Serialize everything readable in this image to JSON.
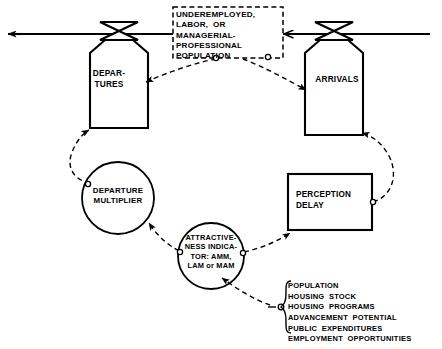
{
  "diagram": {
    "stock": {
      "label": "UNDEREMPLOYED,\nLABOR,  OR\nMANAGERIAL-\nPROFESSIONAL\nPOPULATION",
      "border_style": "dashed"
    },
    "rates": [
      {
        "id": "departures",
        "label": "DEPAR-\nTURES",
        "shape": "valve"
      },
      {
        "id": "arrivals",
        "label": "ARRIVALS",
        "shape": "valve"
      }
    ],
    "auxiliaries": [
      {
        "id": "departure-multiplier",
        "label": "DEPARTURE\nMULTIPLIER",
        "shape": "circle"
      },
      {
        "id": "attractiveness-indicator",
        "label": "ATTRACTIVE-\nNESS INDICA-\nTOR: AMM,\nLAM or MAM",
        "shape": "circle"
      }
    ],
    "delays": [
      {
        "id": "perception-delay",
        "label": "PERCEPTION\nDELAY",
        "shape": "rectangle"
      }
    ],
    "factor_list": {
      "items": [
        "POPULATION",
        "HOUSING  STOCK",
        "HOUSING  PROGRAMS",
        "ADVANCEMENT  POTENTIAL",
        "PUBLIC  EXPENDITURES",
        "EMPLOYMENT  OPPORTUNITIES"
      ],
      "text": "POPULATION\nHOUSING  STOCK\nHOUSING  PROGRAMS\nADVANCEMENT  POTENTIAL\nPUBLIC  EXPENDITURES\nEMPLOYMENT  OPPORTUNITIES",
      "brace_style": "curly"
    },
    "colors": {
      "ink": "#000000",
      "background": "#ffffff"
    }
  }
}
